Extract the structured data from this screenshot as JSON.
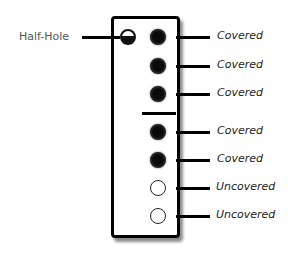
{
  "diagram": {
    "title": "",
    "half_hole": {
      "label": "Half-Hole",
      "state": "half-covered"
    },
    "holes": [
      {
        "label": "Covered",
        "state": "covered"
      },
      {
        "label": "Covered",
        "state": "covered"
      },
      {
        "label": "Covered",
        "state": "covered"
      },
      {
        "label": "Covered",
        "state": "covered"
      },
      {
        "label": "Covered",
        "state": "covered"
      },
      {
        "label": "Uncovered",
        "state": "uncovered"
      },
      {
        "label": "Uncovered",
        "state": "uncovered"
      }
    ],
    "colors": {
      "line": "#000000",
      "hole_filled": "#0a0a0a",
      "label_left": "#555555",
      "label_right": "#222222"
    }
  }
}
